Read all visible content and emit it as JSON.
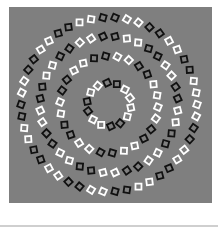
{
  "image": {
    "subject": "concentric circles optical illusion",
    "background_color": "#7f7f7f",
    "square_colors": [
      "#ffffff",
      "#111111"
    ],
    "center": [
      109,
      104.5
    ],
    "square_size": 6,
    "rings": [
      {
        "radius": 88,
        "count": 46,
        "offset_deg": 0,
        "tilt_deg": 20
      },
      {
        "radius": 69,
        "count": 36,
        "offset_deg": 5,
        "tilt_deg": -20
      },
      {
        "radius": 49,
        "count": 26,
        "offset_deg": 3,
        "tilt_deg": 20
      },
      {
        "radius": 22,
        "count": 14,
        "offset_deg": 8,
        "tilt_deg": -20
      }
    ]
  },
  "divider_color": "#cfcfcf"
}
